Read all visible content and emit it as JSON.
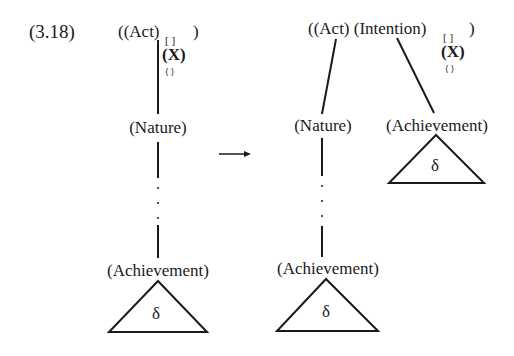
{
  "example_number": "(3.18)",
  "arrow": "→",
  "left_tree": {
    "root": {
      "open": "((Act)",
      "subscript_brackets": "[ ]",
      "close": ")",
      "feature_x": "(X)",
      "feature_angle": "⟨ ⟩"
    },
    "middle_node": "(Nature)",
    "bottom_node": "(Achievement)",
    "triangle_label": "δ"
  },
  "right_tree": {
    "root": {
      "open": "((Act) (Intention)",
      "subscript_brackets": "[ ]",
      "close": ")",
      "feature_x": "(X)",
      "feature_angle": "⟨ ⟩"
    },
    "left_child": "(Nature)",
    "right_child": "(Achievement)",
    "right_child_triangle_label": "δ",
    "bottom_node": "(Achievement)",
    "bottom_triangle_label": "δ"
  }
}
